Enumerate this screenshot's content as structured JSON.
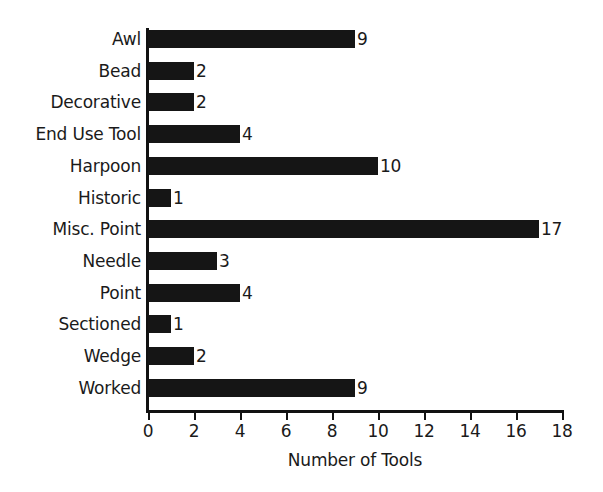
{
  "chart_data": {
    "type": "bar",
    "orientation": "horizontal",
    "title": "",
    "xlabel": "Number of Tools",
    "ylabel": "",
    "categories": [
      "Awl",
      "Bead",
      "Decorative",
      "End Use Tool",
      "Harpoon",
      "Historic",
      "Misc. Point",
      "Needle",
      "Point",
      "Sectioned",
      "Wedge",
      "Worked"
    ],
    "values": [
      9,
      2,
      2,
      4,
      10,
      1,
      17,
      3,
      4,
      1,
      2,
      9
    ],
    "data_labels": [
      "9",
      "2",
      "2",
      "4",
      "10",
      "1",
      "17",
      "3",
      "4",
      "1",
      "2",
      "9"
    ],
    "xlim": [
      0,
      18
    ],
    "xticks": [
      0,
      2,
      4,
      6,
      8,
      10,
      12,
      14,
      16,
      18
    ],
    "xtick_labels": [
      "0",
      "2",
      "4",
      "6",
      "8",
      "10",
      "12",
      "14",
      "16",
      "18"
    ],
    "grid": false,
    "legend": false,
    "bar_color": "#151515",
    "background_color": "#ffffff",
    "axis_color": "#111111",
    "text_color": "#1a1a1a"
  }
}
